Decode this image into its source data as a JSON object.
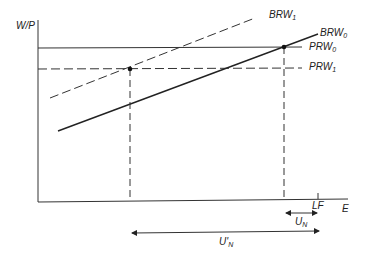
{
  "diagram": {
    "title": "",
    "y_axis_label": "W/P",
    "x_axis_label": "E",
    "colors": {
      "ink": "#222222",
      "background": "#ffffff"
    },
    "curves": [
      {
        "id": "BRW1",
        "label_main": "BRW",
        "label_sub": "1",
        "style": "dashed"
      },
      {
        "id": "BRW0",
        "label_main": "BRW",
        "label_sub": "0",
        "style": "solid"
      },
      {
        "id": "PRW0",
        "label_main": "PRW",
        "label_sub": "0",
        "style": "solid"
      },
      {
        "id": "PRW1",
        "label_main": "PRW",
        "label_sub": "1",
        "style": "dashed"
      }
    ],
    "tick_labels": {
      "lf": "LF"
    },
    "arrows": [
      {
        "id": "UN",
        "label_main": "U",
        "label_sub": "N"
      },
      {
        "id": "UN_prime",
        "label_main": "U'",
        "label_sub": "N"
      }
    ]
  }
}
